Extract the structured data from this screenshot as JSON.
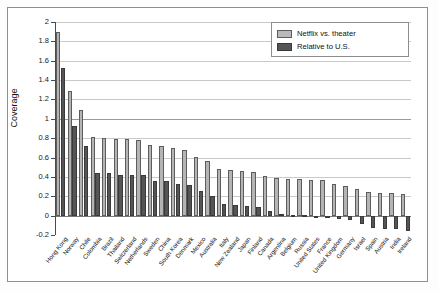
{
  "chart_data": {
    "type": "bar",
    "title": "",
    "xlabel": "",
    "ylabel": "Coverage",
    "ylim": [
      -0.2,
      2
    ],
    "yticks": [
      2,
      1.8,
      1.6,
      1.4,
      1.2,
      1,
      0.8,
      0.6,
      0.4,
      0.2,
      0,
      -0.2
    ],
    "ytick_labels": [
      "2",
      "1.8",
      "1.6",
      "1.4",
      "1.2",
      "1",
      "0.8",
      "0.6",
      "0.4",
      "0.2",
      "0",
      "-0.2"
    ],
    "grid": true,
    "legend_position": "top-right",
    "categories": [
      "Hong Kong",
      "Norway",
      "Chile",
      "Colombia",
      "Brazil",
      "Thailand",
      "Switzerland",
      "Netherlands",
      "Sweden",
      "China",
      "South Korea",
      "Denmark",
      "Mexico",
      "Australia",
      "Italy",
      "New Zealand",
      "Japan",
      "Finland",
      "Canada",
      "Argentina",
      "Belgium",
      "Russia",
      "United States",
      "France",
      "United Kingdom",
      "Germany",
      "Israel",
      "Spain",
      "Austria",
      "India",
      "Ireland"
    ],
    "series": [
      {
        "name": "Netflix vs. theater",
        "color": "#b4b4b4",
        "values": [
          1.9,
          1.29,
          1.09,
          0.81,
          0.8,
          0.79,
          0.79,
          0.78,
          0.73,
          0.72,
          0.7,
          0.68,
          0.61,
          0.56,
          0.48,
          0.47,
          0.46,
          0.45,
          0.41,
          0.39,
          0.38,
          0.38,
          0.37,
          0.37,
          0.33,
          0.31,
          0.28,
          0.24,
          0.23,
          0.23,
          0.22
        ]
      },
      {
        "name": "Relative to U.S.",
        "color": "#555555",
        "values": [
          1.53,
          0.93,
          0.72,
          0.44,
          0.44,
          0.42,
          0.42,
          0.42,
          0.36,
          0.36,
          0.33,
          0.32,
          0.25,
          0.2,
          0.12,
          0.11,
          0.1,
          0.09,
          0.05,
          0.02,
          0.01,
          0.01,
          0.0,
          0.0,
          -0.04,
          -0.05,
          -0.09,
          -0.13,
          -0.14,
          -0.14,
          -0.16
        ]
      }
    ]
  },
  "legend": {
    "items": [
      {
        "label": "Netflix vs. theater",
        "swatch": "light"
      },
      {
        "label": "Relative to U.S.",
        "swatch": "dark"
      }
    ]
  }
}
